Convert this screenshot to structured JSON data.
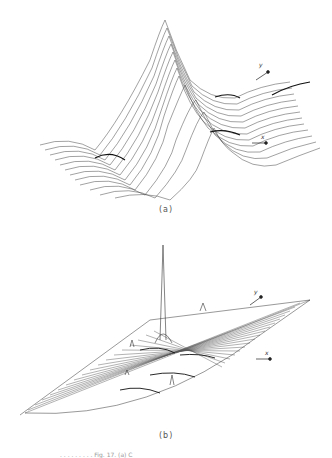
{
  "figure": {
    "panels": [
      {
        "label": "(a)",
        "axes": {
          "x": "x",
          "y": "y"
        }
      },
      {
        "label": "(b)",
        "axes": {
          "x": "x",
          "y": "y"
        }
      }
    ],
    "caption_fragment": ". . . . . . . . . Fig. 17. (a) C"
  }
}
